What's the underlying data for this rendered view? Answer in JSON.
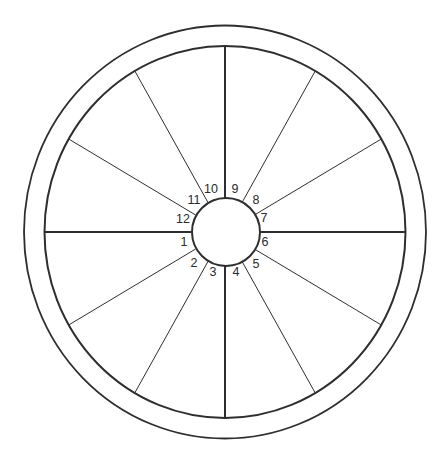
{
  "diagram": {
    "type": "astrological-chart-wheel",
    "colors": {
      "background": "#ffffff",
      "line": "#2e2e2e",
      "label": "#2a2a2a"
    },
    "house_count": 12,
    "houses": [
      {
        "number": "1",
        "x": 184,
        "y": 242
      },
      {
        "number": "2",
        "x": 194,
        "y": 263
      },
      {
        "number": "3",
        "x": 213,
        "y": 272
      },
      {
        "number": "4",
        "x": 236,
        "y": 272
      },
      {
        "number": "5",
        "x": 256,
        "y": 264
      },
      {
        "number": "6",
        "x": 265,
        "y": 242
      },
      {
        "number": "7",
        "x": 264,
        "y": 218
      },
      {
        "number": "8",
        "x": 256,
        "y": 200
      },
      {
        "number": "9",
        "x": 235,
        "y": 189
      },
      {
        "number": "10",
        "x": 211,
        "y": 189
      },
      {
        "number": "11",
        "x": 194,
        "y": 200
      },
      {
        "number": "12",
        "x": 183,
        "y": 219
      }
    ]
  }
}
